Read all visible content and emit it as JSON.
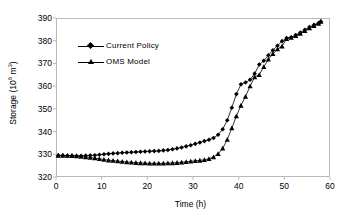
{
  "chart_data": {
    "type": "line",
    "title": "",
    "xlabel": "Time (h)",
    "ylabel": "Storage (10^6 m^3)",
    "ylabel_base": "Storage (10",
    "ylabel_exp1": "6",
    "ylabel_mid": " m",
    "ylabel_exp2": "3",
    "ylabel_end": ")",
    "xlim": [
      0,
      60
    ],
    "ylim": [
      320,
      390
    ],
    "xticks": [
      0,
      10,
      20,
      30,
      40,
      50,
      60
    ],
    "yticks": [
      320,
      330,
      340,
      350,
      360,
      370,
      380,
      390
    ],
    "grid": false,
    "legend_position": "upper-left-inside",
    "line_color": "#000000",
    "frame_color": "#b9b9b9",
    "background": "#ffffff",
    "x": [
      0.5,
      1.5,
      2.5,
      3.5,
      4.5,
      5.5,
      6.5,
      7.5,
      8.5,
      9.5,
      10.5,
      11.5,
      12.5,
      13.5,
      14.5,
      15.5,
      16.5,
      17.5,
      18.5,
      19.5,
      20.5,
      21.5,
      22.5,
      23.5,
      24.5,
      25.5,
      26.5,
      27.5,
      28.5,
      29.5,
      30.5,
      31.5,
      32.5,
      33.5,
      34.5,
      35.5,
      36.5,
      37.5,
      38.5,
      39.5,
      40.5,
      41.5,
      42.5,
      43.5,
      44.5,
      45.5,
      46.5,
      47.5,
      48.5,
      49.5,
      50.5,
      51.5,
      52.5,
      53.5,
      54.5,
      55.5,
      56.5,
      57.5,
      58.0
    ],
    "series": [
      {
        "name": "Current Policy",
        "marker": "diamond",
        "values": [
          329.5,
          329.5,
          329.4,
          329.4,
          329.3,
          329.3,
          329.4,
          329.5,
          329.6,
          329.8,
          330.0,
          330.2,
          330.4,
          330.5,
          330.7,
          330.8,
          330.9,
          331.0,
          331.1,
          331.2,
          331.3,
          331.4,
          331.5,
          331.7,
          331.9,
          332.2,
          332.6,
          333.0,
          333.5,
          334.0,
          334.6,
          335.2,
          335.8,
          336.4,
          337.2,
          338.6,
          341.0,
          345.0,
          350.5,
          356.5,
          360.8,
          361.6,
          362.8,
          365.5,
          369.5,
          371.2,
          373.6,
          375.8,
          377.8,
          379.8,
          381.2,
          381.5,
          382.5,
          383.6,
          384.8,
          386.0,
          387.0,
          387.8,
          388.5
        ]
      },
      {
        "name": "OMS Model",
        "marker": "triangle",
        "values": [
          329.5,
          329.5,
          329.4,
          329.3,
          329.2,
          329.0,
          328.8,
          328.6,
          328.3,
          328.0,
          327.7,
          327.4,
          327.2,
          327.0,
          326.8,
          326.6,
          326.5,
          326.3,
          326.2,
          326.1,
          326.0,
          326.0,
          326.0,
          326.0,
          326.1,
          326.2,
          326.3,
          326.5,
          326.7,
          326.9,
          327.1,
          327.3,
          327.6,
          328.0,
          328.8,
          330.2,
          332.6,
          336.5,
          341.5,
          346.8,
          351.5,
          355.4,
          360.0,
          364.0,
          365.0,
          368.5,
          371.8,
          374.2,
          376.3,
          377.6,
          380.8,
          381.4,
          382.2,
          383.2,
          384.4,
          385.6,
          386.6,
          387.6,
          388.4
        ]
      }
    ]
  }
}
